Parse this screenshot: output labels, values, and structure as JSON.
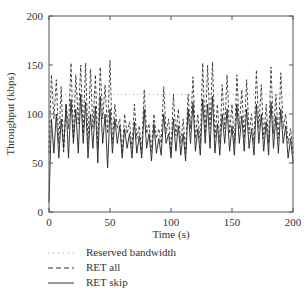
{
  "chart_data": {
    "type": "line",
    "title": "",
    "xlabel": "Time (s)",
    "ylabel": "Throughput (kbps)",
    "xlim": [
      0,
      200
    ],
    "ylim": [
      0,
      200
    ],
    "xticks": [
      0,
      50,
      100,
      150,
      200
    ],
    "yticks": [
      0,
      50,
      100,
      150,
      200
    ],
    "xtick_labels": [
      "0",
      "50",
      "100",
      "150",
      "200"
    ],
    "ytick_labels": [
      "0",
      "50",
      "100",
      "150",
      "200"
    ],
    "grid": false,
    "legend_position": "below",
    "x": [
      0,
      2,
      4,
      6,
      8,
      10,
      12,
      14,
      16,
      18,
      20,
      22,
      24,
      26,
      28,
      30,
      32,
      34,
      36,
      38,
      40,
      42,
      44,
      46,
      48,
      50,
      52,
      54,
      56,
      58,
      60,
      62,
      64,
      66,
      68,
      70,
      72,
      74,
      76,
      78,
      80,
      82,
      84,
      86,
      88,
      90,
      92,
      94,
      96,
      98,
      100,
      102,
      104,
      106,
      108,
      110,
      112,
      114,
      116,
      118,
      120,
      122,
      124,
      126,
      128,
      130,
      132,
      134,
      136,
      138,
      140,
      142,
      144,
      146,
      148,
      150,
      152,
      154,
      156,
      158,
      160,
      162,
      164,
      166,
      168,
      170,
      172,
      174,
      176,
      178,
      180,
      182,
      184,
      186,
      188,
      190,
      192,
      194,
      196,
      198,
      200
    ],
    "series": [
      {
        "name": "Reserved bandwidth",
        "style": "dotted",
        "values": [
          120,
          120,
          120,
          120,
          120,
          120,
          120,
          120,
          120,
          120,
          120,
          120,
          120,
          120,
          120,
          120,
          120,
          120,
          120,
          120,
          120,
          120,
          120,
          120,
          120,
          120,
          120,
          120,
          120,
          120,
          120,
          120,
          120,
          120,
          120,
          120,
          120,
          120,
          120,
          120,
          120,
          120,
          120,
          120,
          120,
          120,
          120,
          120,
          120,
          120,
          120,
          120,
          120,
          120,
          120,
          120,
          120,
          120,
          120,
          120,
          120,
          120,
          120,
          120,
          120,
          120,
          120,
          120,
          120,
          120,
          120,
          120,
          120,
          120,
          120,
          120,
          120,
          120,
          120,
          120,
          120,
          120,
          120,
          120,
          120,
          120,
          120,
          120,
          120,
          120,
          120,
          120,
          120,
          120,
          120,
          120,
          120,
          120,
          120,
          120,
          120
        ]
      },
      {
        "name": "RET all",
        "style": "dashed",
        "values": [
          60,
          140,
          95,
          135,
          70,
          128,
          60,
          110,
          85,
          152,
          75,
          140,
          90,
          150,
          80,
          152,
          70,
          146,
          85,
          140,
          65,
          148,
          95,
          130,
          80,
          155,
          70,
          110,
          85,
          95,
          60,
          100,
          80,
          92,
          65,
          110,
          75,
          88,
          60,
          125,
          80,
          90,
          62,
          100,
          75,
          85,
          70,
          128,
          80,
          95,
          60,
          120,
          78,
          105,
          70,
          95,
          60,
          120,
          85,
          138,
          75,
          100,
          70,
          152,
          80,
          150,
          85,
          153,
          75,
          110,
          70,
          130,
          85,
          140,
          80,
          110,
          70,
          140,
          85,
          125,
          75,
          135,
          80,
          100,
          70,
          145,
          85,
          130,
          75,
          110,
          70,
          148,
          80,
          120,
          75,
          142,
          85,
          100,
          70,
          85,
          60
        ]
      },
      {
        "name": "RET skip",
        "style": "solid",
        "values": [
          10,
          95,
          60,
          100,
          55,
          95,
          65,
          110,
          55,
          115,
          70,
          105,
          60,
          120,
          70,
          112,
          55,
          100,
          65,
          108,
          50,
          118,
          70,
          100,
          45,
          105,
          60,
          95,
          70,
          88,
          55,
          85,
          65,
          80,
          55,
          92,
          60,
          78,
          55,
          105,
          65,
          80,
          52,
          90,
          60,
          75,
          58,
          100,
          70,
          80,
          55,
          95,
          62,
          88,
          58,
          80,
          52,
          105,
          70,
          112,
          62,
          85,
          58,
          115,
          70,
          110,
          65,
          118,
          60,
          90,
          58,
          100,
          70,
          105,
          62,
          88,
          58,
          110,
          70,
          98,
          62,
          105,
          65,
          85,
          58,
          110,
          70,
          100,
          62,
          92,
          58,
          112,
          65,
          98,
          60,
          105,
          70,
          88,
          55,
          75,
          50
        ]
      }
    ]
  },
  "legend": {
    "items": [
      {
        "label": "Reserved bandwidth",
        "style": "dotted"
      },
      {
        "label": "RET all",
        "style": "dashed"
      },
      {
        "label": "RET skip",
        "style": "solid"
      }
    ]
  },
  "colors": {
    "axis": "#555555",
    "line": "#222222",
    "reserved": "#aaaaaa"
  }
}
